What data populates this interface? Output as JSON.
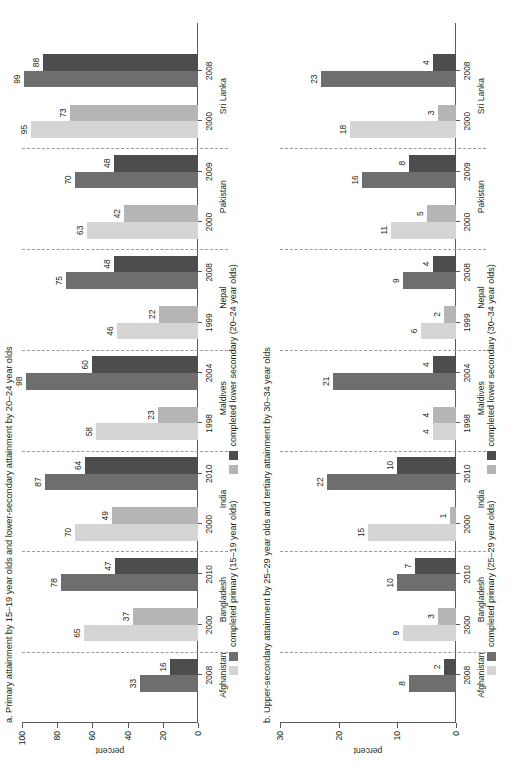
{
  "figure": {
    "axis_label": "percent"
  },
  "colors": {
    "primary_early": "#d5d5d5",
    "lowersec_early": "#b5b5b5",
    "primary_late": "#6e6e6e",
    "lowersec_late": "#4d4d4d",
    "axis": "#58595b",
    "separator": "#9a9a9a"
  },
  "panels": [
    {
      "id": "a",
      "title": "a. Primary attainment by 15–19 year olds and lower-secondary attainment by 20–24 year olds",
      "axis_label": "percent",
      "legend": [
        {
          "label": "completed primary (15–19 year olds)",
          "color_early": "#d5d5d5",
          "color_late": "#6e6e6e"
        },
        {
          "label": "completed lower secondary (20–24 year olds)",
          "color_early": "#b5b5b5",
          "color_late": "#4d4d4d"
        }
      ]
    },
    {
      "id": "b",
      "title": "b. Upper-secondary attainment by 25–29 year olds and tertiary attainment by 30–34 year olds",
      "axis_label": "percent",
      "legend": [
        {
          "label": "completed primary (25–29 year olds)",
          "color_early": "#d5d5d5",
          "color_late": "#6e6e6e"
        },
        {
          "label": "completed lower secondary (30–34 year olds)",
          "color_early": "#b5b5b5",
          "color_late": "#4d4d4d"
        }
      ]
    }
  ],
  "chart_data": [
    {
      "type": "bar",
      "panel": "a",
      "title": "a. Primary attainment by 15–19 year olds and lower-secondary attainment by 20–24 year olds",
      "xlabel": "",
      "ylabel": "percent",
      "ylim": [
        0,
        100
      ],
      "yticks": [
        0,
        20,
        40,
        60,
        80,
        100
      ],
      "grid": false,
      "legend_position": "bottom",
      "series": [
        {
          "name": "completed primary (15–19 year olds)",
          "key": "primary"
        },
        {
          "name": "completed lower secondary (20–24 year olds)",
          "key": "lower_secondary"
        }
      ],
      "groups": [
        {
          "country": "Afghanistan",
          "years": [
            {
              "year": "2008",
              "period": "late",
              "primary": 33,
              "lower_secondary": 16
            }
          ]
        },
        {
          "country": "Bangladesh",
          "years": [
            {
              "year": "2000",
              "period": "early",
              "primary": 65,
              "lower_secondary": 37
            },
            {
              "year": "2010",
              "period": "late",
              "primary": 78,
              "lower_secondary": 47
            }
          ]
        },
        {
          "country": "India",
          "years": [
            {
              "year": "2000",
              "period": "early",
              "primary": 70,
              "lower_secondary": 49
            },
            {
              "year": "2010",
              "period": "late",
              "primary": 87,
              "lower_secondary": 64
            }
          ]
        },
        {
          "country": "Maldives",
          "years": [
            {
              "year": "1998",
              "period": "early",
              "primary": 58,
              "lower_secondary": 23
            },
            {
              "year": "2004",
              "period": "late",
              "primary": 98,
              "lower_secondary": 60
            }
          ]
        },
        {
          "country": "Nepal",
          "years": [
            {
              "year": "1999",
              "period": "early",
              "primary": 46,
              "lower_secondary": 22
            },
            {
              "year": "2008",
              "period": "late",
              "primary": 75,
              "lower_secondary": 48
            }
          ]
        },
        {
          "country": "Pakistan",
          "years": [
            {
              "year": "2000",
              "period": "early",
              "primary": 63,
              "lower_secondary": 42
            },
            {
              "year": "2009",
              "period": "late",
              "primary": 70,
              "lower_secondary": 48
            }
          ]
        },
        {
          "country": "Sri Lanka",
          "years": [
            {
              "year": "2000",
              "period": "early",
              "primary": 95,
              "lower_secondary": 73
            },
            {
              "year": "2008",
              "period": "late",
              "primary": 99,
              "lower_secondary": 88
            }
          ]
        }
      ]
    },
    {
      "type": "bar",
      "panel": "b",
      "title": "b. Upper-secondary attainment by 25–29 year olds and tertiary attainment by 30–34 year olds",
      "xlabel": "",
      "ylabel": "percent",
      "ylim": [
        0,
        30
      ],
      "yticks": [
        0,
        10,
        20,
        30
      ],
      "grid": false,
      "legend_position": "bottom",
      "series": [
        {
          "name": "completed primary (25–29 year olds)",
          "key": "primary"
        },
        {
          "name": "completed lower secondary (30–34 year olds)",
          "key": "lower_secondary"
        }
      ],
      "groups": [
        {
          "country": "Afghanistan",
          "years": [
            {
              "year": "2008",
              "period": "late",
              "primary": 8,
              "lower_secondary": 2
            }
          ]
        },
        {
          "country": "Bangladesh",
          "years": [
            {
              "year": "2000",
              "period": "early",
              "primary": 9,
              "lower_secondary": 3
            },
            {
              "year": "2010",
              "period": "late",
              "primary": 10,
              "lower_secondary": 7
            }
          ]
        },
        {
          "country": "India",
          "years": [
            {
              "year": "2000",
              "period": "early",
              "primary": 15,
              "lower_secondary": 1
            },
            {
              "year": "2010",
              "period": "late",
              "primary": 22,
              "lower_secondary": 10
            }
          ]
        },
        {
          "country": "Maldives",
          "years": [
            {
              "year": "1998",
              "period": "early",
              "primary": 4,
              "lower_secondary": 4
            },
            {
              "year": "2004",
              "period": "late",
              "primary": 21,
              "lower_secondary": 4
            }
          ]
        },
        {
          "country": "Nepal",
          "years": [
            {
              "year": "1999",
              "period": "early",
              "primary": 6,
              "lower_secondary": 2
            },
            {
              "year": "2008",
              "period": "late",
              "primary": 9,
              "lower_secondary": 4
            }
          ]
        },
        {
          "country": "Pakistan",
          "years": [
            {
              "year": "2000",
              "period": "early",
              "primary": 11,
              "lower_secondary": 5
            },
            {
              "year": "2009",
              "period": "late",
              "primary": 16,
              "lower_secondary": 8
            }
          ]
        },
        {
          "country": "Sri Lanka",
          "years": [
            {
              "year": "2000",
              "period": "early",
              "primary": 18,
              "lower_secondary": 3
            },
            {
              "year": "2008",
              "period": "late",
              "primary": 23,
              "lower_secondary": 4
            }
          ]
        }
      ]
    }
  ]
}
